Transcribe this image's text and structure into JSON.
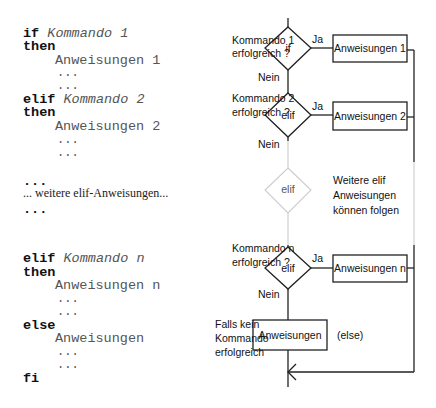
{
  "code": {
    "lines": [
      {
        "kw": "if",
        "cmd": "Kommando 1"
      },
      {
        "kw": "then"
      },
      {
        "indent": "Anweisungen 1"
      },
      {
        "dots": "..."
      },
      {
        "dots": "..."
      },
      {
        "kw": "elif",
        "cmd": "Kommando 2"
      },
      {
        "kw": "then"
      },
      {
        "indent": "Anweisungen 2"
      },
      {
        "dots": "..."
      },
      {
        "dots": "..."
      },
      {
        "kwdots": "..."
      },
      {
        "note": "... weitere elif-Anweisungen..."
      },
      {
        "kwdots": "..."
      },
      {
        "kw": "elif",
        "cmd": "Kommando n"
      },
      {
        "kw": "then"
      },
      {
        "indent": "Anweisungen n"
      },
      {
        "dots": "..."
      },
      {
        "dots": "..."
      },
      {
        "kw": "else"
      },
      {
        "indent": "Anweisungen"
      },
      {
        "dots": "..."
      },
      {
        "dots": "..."
      },
      {
        "kw": "fi"
      }
    ]
  },
  "flow": {
    "d1": {
      "label": "if",
      "q1": "Kommando 1",
      "q2": "erfolgreich ?",
      "yes": "Ja",
      "no": "Nein",
      "box": "Anweisungen 1"
    },
    "d2": {
      "label": "elif",
      "q1": "Kommando 2",
      "q2": "erfolgreich ?",
      "yes": "Ja",
      "no": "Nein",
      "box": "Anweisungen 2"
    },
    "dmore": {
      "label": "elif",
      "n1": "Weitere elif",
      "n2": "Anweisungen",
      "n3": "können folgen"
    },
    "dn": {
      "label": "elif",
      "q1": "Kommando n",
      "q2": "erfolgreich ?",
      "yes": "Ja",
      "no": "Nein",
      "box": "Anweisungen n"
    },
    "else": {
      "box": "Anweisungen",
      "tag": "(else)",
      "c1": "Falls kein",
      "c2": "Kommando",
      "c3": "erfolgreich"
    }
  }
}
